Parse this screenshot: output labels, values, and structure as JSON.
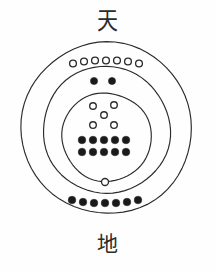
{
  "figure": {
    "title_top_glyph": "天",
    "title_top_glyph_name": "heaven",
    "title_bottom_glyph": "地",
    "title_bottom_glyph_name": "earth",
    "style": "hand-drawn ink diagram",
    "stroke_color": "#2b2b2b",
    "fill_color": "#ffffff",
    "dot_fill_color": "#1a1a1a",
    "background_color": "#fefefe"
  },
  "rings": [
    {
      "name": "outer-ring",
      "cx": 106.5,
      "cy": 128,
      "r": 85.5
    },
    {
      "name": "middle-ring",
      "cx": 106.5,
      "cy": 130,
      "r": 63.5
    },
    {
      "name": "inner-ring",
      "cx": 106.5,
      "cy": 137,
      "r": 44.5
    }
  ],
  "marker_groups": [
    {
      "name": "outer-open-circle-arc",
      "marker": "open-circle",
      "count": 7,
      "region": "between outer and middle ring, top",
      "points": [
        {
          "cx": 73,
          "cy": 63.5
        },
        {
          "cx": 84,
          "cy": 61.5
        },
        {
          "cx": 95,
          "cy": 60.5
        },
        {
          "cx": 106,
          "cy": 60.5
        },
        {
          "cx": 117,
          "cy": 60.5
        },
        {
          "cx": 128,
          "cy": 61.5
        },
        {
          "cx": 139,
          "cy": 63.5
        }
      ],
      "radius": 4.1
    },
    {
      "name": "middle-filled-dot-pair",
      "marker": "filled-dot",
      "count": 2,
      "region": "between middle and inner ring, top",
      "points": [
        {
          "cx": 94,
          "cy": 81
        },
        {
          "cx": 112,
          "cy": 81
        }
      ],
      "radius": 3.6
    },
    {
      "name": "inner-open-circle-quincunx",
      "marker": "open-circle",
      "count": 5,
      "region": "inner ring, upper",
      "points": [
        {
          "cx": 93,
          "cy": 106
        },
        {
          "cx": 114,
          "cy": 105
        },
        {
          "cx": 104,
          "cy": 115
        },
        {
          "cx": 93,
          "cy": 125
        },
        {
          "cx": 114,
          "cy": 125
        }
      ],
      "radius": 4.0
    },
    {
      "name": "inner-filled-dot-row-1",
      "marker": "filled-dot",
      "count": 5,
      "region": "inner ring, lower",
      "points": [
        {
          "cx": 82,
          "cy": 140
        },
        {
          "cx": 93,
          "cy": 140
        },
        {
          "cx": 104,
          "cy": 140
        },
        {
          "cx": 115,
          "cy": 140
        },
        {
          "cx": 126,
          "cy": 140
        }
      ],
      "radius": 3.8
    },
    {
      "name": "inner-filled-dot-row-2",
      "marker": "filled-dot",
      "count": 5,
      "region": "inner ring, lower",
      "points": [
        {
          "cx": 82,
          "cy": 152
        },
        {
          "cx": 93,
          "cy": 152
        },
        {
          "cx": 104,
          "cy": 152
        },
        {
          "cx": 115,
          "cy": 152
        },
        {
          "cx": 126,
          "cy": 152
        }
      ],
      "radius": 3.8
    },
    {
      "name": "lower-single-open-circle",
      "marker": "open-circle",
      "count": 1,
      "region": "between inner and middle ring, bottom",
      "points": [
        {
          "cx": 105,
          "cy": 182
        }
      ],
      "radius": 4.2
    },
    {
      "name": "outer-filled-dot-arc",
      "marker": "filled-dot",
      "count": 7,
      "region": "between outer and middle ring, bottom",
      "points": [
        {
          "cx": 72,
          "cy": 200
        },
        {
          "cx": 83,
          "cy": 202
        },
        {
          "cx": 94,
          "cy": 203
        },
        {
          "cx": 105,
          "cy": 203
        },
        {
          "cx": 116,
          "cy": 203
        },
        {
          "cx": 127,
          "cy": 202
        },
        {
          "cx": 138,
          "cy": 200
        }
      ],
      "radius": 3.8
    }
  ],
  "counts_summary": {
    "open_circles_total": 13,
    "filled_dots_total": 19
  }
}
